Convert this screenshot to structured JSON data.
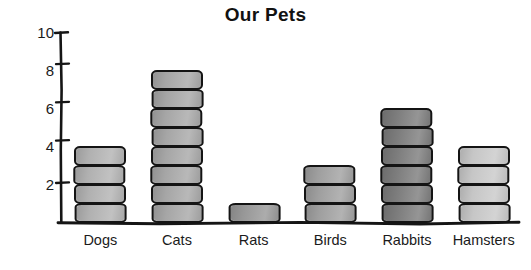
{
  "chart_data": {
    "type": "bar",
    "title": "Our Pets",
    "subtitle": "",
    "xlabel": "",
    "ylabel": "",
    "categories": [
      "Dogs",
      "Cats",
      "Rats",
      "Birds",
      "Rabbits",
      "Hamsters"
    ],
    "values": [
      4,
      8,
      1,
      3,
      6,
      4
    ],
    "ylim": [
      0,
      10
    ],
    "y_ticks": [
      2,
      4,
      6,
      8,
      10
    ],
    "y_tick_labels": [
      "2",
      "4",
      "6",
      "8",
      "10"
    ],
    "grid": false,
    "legend": false,
    "style": "hand-drawn stacked unit blocks",
    "bar_colors": [
      "#b4b4b4",
      "#a9a9a9",
      "#9a9a9a",
      "#a2a2a2",
      "#7e7e7e",
      "#cacaca"
    ],
    "outline_color": "#141414",
    "background": "#ffffff",
    "bars": [
      {
        "label": "Dogs",
        "value": 4,
        "blocks": 4,
        "fill": "#b4b4b4"
      },
      {
        "label": "Cats",
        "value": 8,
        "blocks": 8,
        "fill": "#a9a9a9"
      },
      {
        "label": "Rats",
        "value": 1,
        "blocks": 1,
        "fill": "#9a9a9a"
      },
      {
        "label": "Birds",
        "value": 3,
        "blocks": 3,
        "fill": "#a2a2a2"
      },
      {
        "label": "Rabbits",
        "value": 6,
        "blocks": 6,
        "fill": "#7e7e7e"
      },
      {
        "label": "Hamsters",
        "value": 4,
        "blocks": 4,
        "fill": "#cacaca"
      }
    ]
  },
  "chart": {
    "title": "Our Pets"
  }
}
